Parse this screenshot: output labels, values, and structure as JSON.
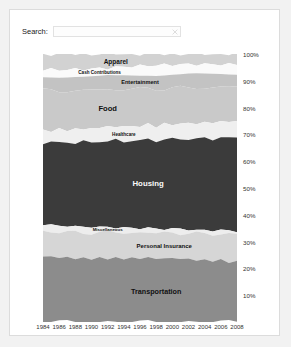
{
  "search": {
    "label": "Search:",
    "value": "",
    "placeholder": "",
    "clear_icon": "clear-icon"
  },
  "chart_data": {
    "type": "area",
    "title": "",
    "xlabel": "",
    "ylabel": "",
    "stacked": true,
    "normalized": true,
    "grid": false,
    "legend_position": "inline-labels",
    "ylim": [
      0,
      100
    ],
    "ytick_labels": [
      "100%",
      "90%",
      "80%",
      "70%",
      "60%",
      "50%",
      "40%",
      "30%",
      "20%",
      "10%"
    ],
    "ytick_values": [
      100,
      90,
      80,
      70,
      60,
      50,
      40,
      30,
      20,
      10
    ],
    "x": [
      1984,
      1985,
      1986,
      1987,
      1988,
      1989,
      1990,
      1991,
      1992,
      1993,
      1994,
      1995,
      1996,
      1997,
      1998,
      1999,
      2000,
      2001,
      2002,
      2003,
      2004,
      2005,
      2006,
      2007,
      2008
    ],
    "xtick_labels": [
      "1984",
      "1986",
      "1988",
      "1990",
      "1992",
      "1994",
      "1996",
      "1998",
      "2000",
      "2002",
      "2004",
      "2006",
      "2008"
    ],
    "xtick_values": [
      1984,
      1986,
      1988,
      1990,
      1992,
      1994,
      1996,
      1998,
      2000,
      2002,
      2004,
      2006,
      2008
    ],
    "series": [
      {
        "name": "Apparel",
        "color": "#d2d2d2",
        "label_color": "dark",
        "values": [
          5.7,
          5.6,
          5.7,
          5.5,
          5.4,
          5.3,
          5.2,
          5.1,
          5.0,
          4.9,
          4.8,
          4.7,
          4.6,
          4.5,
          4.5,
          4.4,
          4.3,
          4.2,
          4.1,
          4.0,
          4.0,
          3.9,
          3.8,
          3.7,
          3.6
        ]
      },
      {
        "name": "Cash Contributions",
        "color": "#fafafa",
        "label_color": "dark",
        "values": [
          2.9,
          3.0,
          3.0,
          3.1,
          3.1,
          3.2,
          3.2,
          3.2,
          3.1,
          3.2,
          3.2,
          3.3,
          3.3,
          3.3,
          3.4,
          3.4,
          3.4,
          3.5,
          3.5,
          3.5,
          3.6,
          3.6,
          3.6,
          3.7,
          3.7
        ]
      },
      {
        "name": "Entertainment",
        "color": "#c3c3c3",
        "label_color": "dark",
        "values": [
          5.0,
          5.0,
          5.1,
          5.1,
          5.2,
          5.2,
          5.1,
          5.1,
          5.0,
          5.1,
          5.1,
          5.2,
          5.2,
          5.1,
          5.1,
          5.1,
          5.0,
          5.0,
          5.1,
          5.1,
          5.0,
          5.0,
          4.9,
          5.0,
          5.0
        ]
      },
      {
        "name": "Food",
        "color": "#c9c9c9",
        "label_color": "dark",
        "values": [
          15.0,
          14.8,
          14.6,
          14.5,
          14.4,
          14.3,
          14.2,
          14.1,
          14.0,
          13.9,
          13.9,
          13.8,
          13.7,
          13.6,
          13.6,
          13.5,
          13.4,
          13.3,
          13.2,
          13.2,
          13.1,
          13.0,
          12.9,
          12.8,
          13.0
        ]
      },
      {
        "name": "Healthcare",
        "color": "#efefef",
        "label_color": "dark",
        "values": [
          4.5,
          4.6,
          4.7,
          4.8,
          4.9,
          5.0,
          5.1,
          5.2,
          5.3,
          5.4,
          5.4,
          5.5,
          5.5,
          5.5,
          5.6,
          5.6,
          5.6,
          5.7,
          5.8,
          5.9,
          5.9,
          6.0,
          6.0,
          6.1,
          6.1
        ]
      },
      {
        "name": "Housing",
        "color": "#3b3b3b",
        "label_color": "light",
        "values": [
          30.5,
          30.7,
          30.9,
          31.0,
          31.2,
          31.3,
          31.5,
          31.6,
          31.8,
          31.9,
          32.0,
          32.1,
          32.3,
          32.4,
          32.6,
          32.8,
          32.9,
          33.1,
          33.3,
          33.5,
          33.6,
          33.8,
          33.9,
          34.1,
          34.2
        ]
      },
      {
        "name": "Miscellaneous",
        "color": "#ededed",
        "label_color": "dark",
        "values": [
          2.6,
          2.6,
          2.5,
          2.5,
          2.4,
          2.4,
          2.3,
          2.3,
          2.3,
          2.2,
          2.2,
          2.2,
          2.1,
          2.1,
          2.1,
          2.0,
          2.0,
          2.0,
          1.9,
          1.9,
          1.9,
          1.8,
          1.8,
          1.8,
          1.7
        ]
      },
      {
        "name": "Personal Insurance",
        "color": "#d6d6d6",
        "label_color": "dark",
        "values": [
          9.2,
          9.2,
          9.1,
          9.2,
          9.2,
          9.3,
          9.3,
          9.4,
          9.4,
          9.5,
          9.5,
          9.5,
          9.6,
          9.7,
          9.7,
          9.8,
          9.9,
          9.9,
          10.0,
          10.0,
          10.1,
          10.1,
          10.2,
          10.2,
          10.3
        ]
      },
      {
        "name": "Transportation",
        "color": "#8c8c8c",
        "label_color": "dark",
        "values": [
          24.6,
          24.5,
          24.4,
          24.3,
          24.2,
          24.0,
          24.1,
          24.0,
          24.1,
          23.9,
          23.9,
          23.7,
          23.7,
          23.8,
          23.4,
          23.4,
          23.5,
          23.3,
          23.1,
          22.9,
          22.8,
          22.8,
          22.9,
          22.6,
          22.4
        ]
      }
    ]
  }
}
